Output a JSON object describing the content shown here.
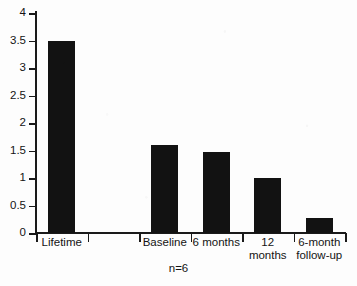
{
  "chart_data": {
    "type": "bar",
    "title": "",
    "subtitle": "",
    "xlabel": "",
    "ylabel": "",
    "categories": [
      "Lifetime",
      "",
      "Baseline",
      "6 months",
      "12 months",
      "6-month follow-up"
    ],
    "category_labels_display": [
      "Lifetime",
      "",
      "Baseline",
      "6 months",
      "12\nmonths",
      "6-month\nfollow-up"
    ],
    "values": [
      3.5,
      null,
      1.6,
      1.47,
      1.0,
      0.27
    ],
    "ylim": [
      0,
      4
    ],
    "ytick_values": [
      0,
      0.5,
      1,
      1.5,
      2,
      2.5,
      3,
      3.5,
      4
    ],
    "ytick_labels": [
      "0",
      "0.5",
      "1",
      "1.5",
      "2",
      "2.5",
      "3",
      "3.5",
      "4"
    ],
    "grid": false,
    "legend": false,
    "legend_position": "none",
    "annotation": "n=6",
    "bar_color": "#121212",
    "axis_color": "#1a1a1a",
    "background_color": "#fdfdfd"
  },
  "caption": {
    "sample_size": "n=6"
  }
}
